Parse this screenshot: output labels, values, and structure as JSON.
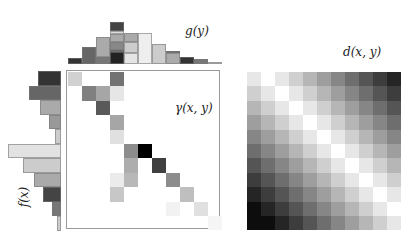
{
  "chart_data": [
    {
      "type": "bar",
      "title": "g(y)",
      "orientation": "vertical",
      "description": "Stacked marginal histogram g(y), 11 bins, segments colored by source x bin",
      "categories": [
        "y1",
        "y2",
        "y3",
        "y4",
        "y5",
        "y6",
        "y7",
        "y8",
        "y9",
        "y10",
        "y11"
      ],
      "values": [
        6,
        17,
        27,
        42,
        31,
        31,
        20,
        13,
        7,
        5,
        2
      ],
      "segments": [
        [
          [
            "#333333",
            6
          ]
        ],
        [
          [
            "#666666",
            17
          ]
        ],
        [
          [
            "#777777",
            7
          ],
          [
            "#aaaaaa",
            20
          ]
        ],
        [
          [
            "#222222",
            12
          ],
          [
            "#555555",
            2
          ],
          [
            "#888888",
            8
          ],
          [
            "#aaaaaa",
            8
          ],
          [
            "#dddddd",
            3
          ],
          [
            "#444444",
            9
          ]
        ],
        [
          [
            "#e4e4e4",
            11
          ],
          [
            "#cccccc",
            11
          ],
          [
            "#aaaaaa",
            9
          ]
        ],
        [
          [
            "#eeeeee",
            31
          ]
        ],
        [
          [
            "#cccccc",
            20
          ]
        ],
        [
          [
            "#aaaaaa",
            11
          ],
          [
            "#666666",
            2
          ]
        ],
        [
          [
            "#333333",
            7
          ]
        ],
        [
          [
            "#777777",
            5
          ]
        ],
        [
          [
            "#cccccc",
            2
          ]
        ]
      ]
    },
    {
      "type": "bar",
      "title": "f(x)",
      "orientation": "horizontal",
      "description": "Marginal histogram f(x), 11 bins, bars extend leftward",
      "categories": [
        "x1",
        "x2",
        "x3",
        "x4",
        "x5",
        "x6",
        "x7",
        "x8",
        "x9",
        "x10",
        "x11"
      ],
      "values": [
        23,
        32,
        21,
        12,
        6,
        53,
        38,
        27,
        18,
        9,
        4
      ],
      "colors": [
        "#333333",
        "#666666",
        "#aaaaaa",
        "#999999",
        "#cccccc",
        "#e2e2e2",
        "#cccccc",
        "#aaaaaa",
        "#444444",
        "#777777",
        "#cccccc"
      ]
    },
    {
      "type": "heatmap",
      "title": "γ(x,y)",
      "description": "Transport plan matrix, 11x11, sparse; values are gray intensity 0-1 (1=black)",
      "rows": 11,
      "cols": 11,
      "cells": [
        {
          "r": 0,
          "c": 0,
          "v": 0.18
        },
        {
          "r": 0,
          "c": 3,
          "v": 0.55
        },
        {
          "r": 1,
          "c": 1,
          "v": 0.5
        },
        {
          "r": 1,
          "c": 2,
          "v": 0.35
        },
        {
          "r": 1,
          "c": 3,
          "v": 0.1
        },
        {
          "r": 2,
          "c": 2,
          "v": 0.65
        },
        {
          "r": 3,
          "c": 3,
          "v": 0.35
        },
        {
          "r": 4,
          "c": 3,
          "v": 0.12
        },
        {
          "r": 5,
          "c": 4,
          "v": 0.45
        },
        {
          "r": 5,
          "c": 5,
          "v": 1.0
        },
        {
          "r": 6,
          "c": 4,
          "v": 0.32
        },
        {
          "r": 6,
          "c": 6,
          "v": 0.75
        },
        {
          "r": 7,
          "c": 3,
          "v": 0.08
        },
        {
          "r": 7,
          "c": 4,
          "v": 0.28
        },
        {
          "r": 7,
          "c": 7,
          "v": 0.45
        },
        {
          "r": 8,
          "c": 3,
          "v": 0.22
        },
        {
          "r": 8,
          "c": 8,
          "v": 0.25
        },
        {
          "r": 9,
          "c": 7,
          "v": 0.05
        },
        {
          "r": 9,
          "c": 9,
          "v": 0.12
        },
        {
          "r": 10,
          "c": 10,
          "v": 0.04
        }
      ]
    },
    {
      "type": "heatmap",
      "title": "d(x,y)",
      "description": "Distance matrix 11x11, |i-j| based grayscale, white on diagonal, darker away",
      "rows": 11,
      "cols": 11,
      "formula": "intensity ~ |row - col| / 10"
    }
  ],
  "labels": {
    "g": "g(y)",
    "f": "f(x)",
    "gamma": "γ(x, y)",
    "d": "d(x, y)"
  }
}
